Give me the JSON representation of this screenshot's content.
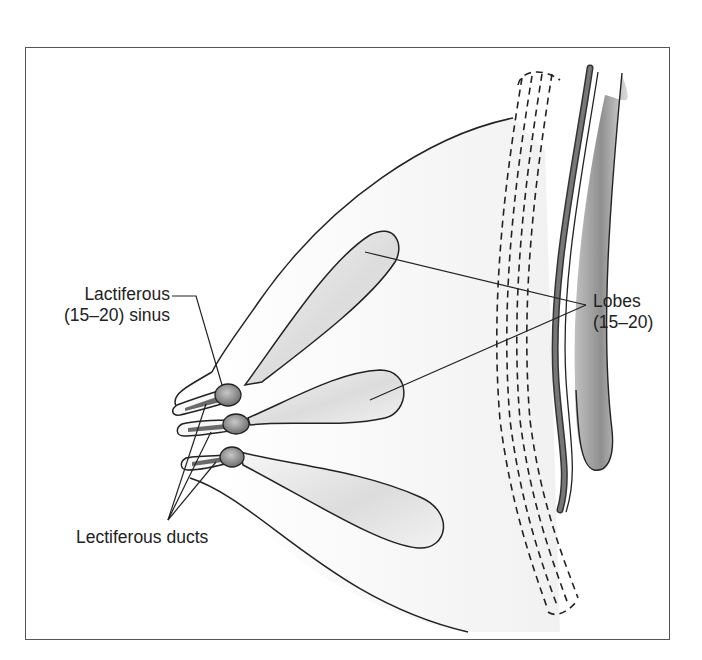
{
  "figure": {
    "colors": {
      "outline": "#2a2a2a",
      "lobe_fill_light": "#f4f4f4",
      "lobe_fill_dark": "#c8c8c8",
      "sinus_fill": "#8a8a8a",
      "muscle_band": "#707070",
      "rib_fill": "#b5b5b5",
      "frame": "#555555"
    }
  },
  "labels": {
    "sinus": {
      "line1": "Lactiferous",
      "line2": "(15–20) sinus"
    },
    "lobes": {
      "line1": "Lobes",
      "line2": "(15–20)"
    },
    "ducts": {
      "text": "Lectiferous ducts"
    }
  }
}
